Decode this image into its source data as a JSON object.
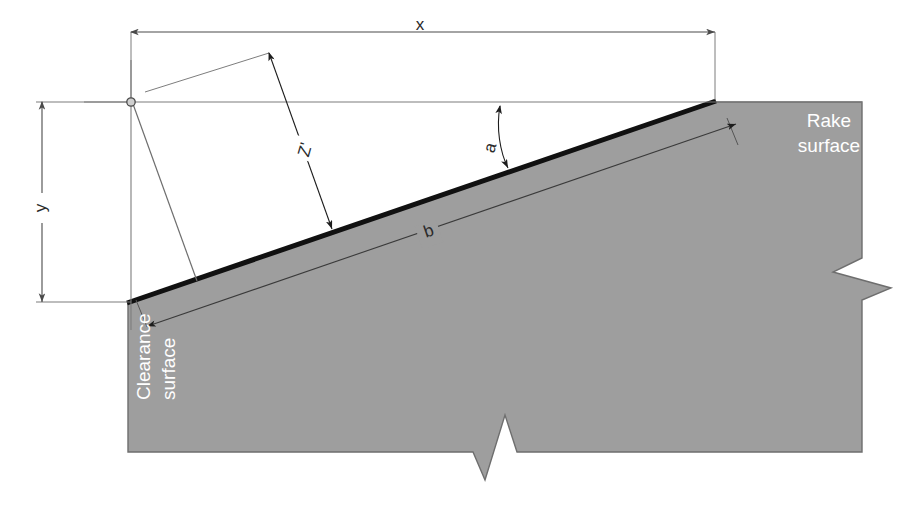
{
  "diagram": {
    "colors": {
      "tool_body_fill": "#9e9e9e",
      "tool_body_stroke": "#6e6e6e",
      "cutting_edge": "#111111",
      "dimension_line": "#5a5a5a",
      "label_text": "#2b2b2b",
      "surface_text": "#ffffff",
      "background": "#ffffff"
    },
    "dimensions": [
      {
        "id": "x",
        "label": "x",
        "orientation": "horizontal",
        "label_x": 420,
        "label_y": 30
      },
      {
        "id": "y",
        "label": "y",
        "orientation": "vertical",
        "label_x": 42,
        "label_y": 208
      },
      {
        "id": "z",
        "label": "Zʹ",
        "orientation": "oblique",
        "label_x": 310,
        "label_y": 150
      },
      {
        "id": "a",
        "label": "a",
        "orientation": "angle-arc",
        "label_x": 493,
        "label_y": 148
      },
      {
        "id": "b",
        "label": "b",
        "orientation": "oblique",
        "label_x": 430,
        "label_y": 235
      }
    ],
    "surfaces": [
      {
        "id": "rake",
        "line1": "Rake",
        "line2": "surface",
        "x": 829,
        "y": 125,
        "rotation": 0
      },
      {
        "id": "clearance",
        "line1": "Clearance",
        "line2": "surface",
        "x": 150,
        "y": 400,
        "rotation": -90
      }
    ]
  }
}
